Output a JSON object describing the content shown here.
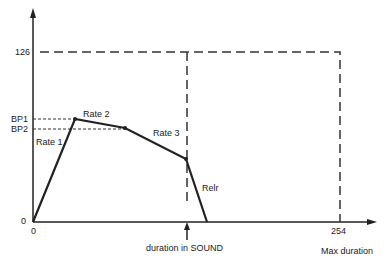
{
  "diagram": {
    "y_ticks": {
      "top": "126",
      "bp1": "BP1",
      "bp2": "BP2",
      "zero": "0"
    },
    "x_ticks": {
      "zero": "0",
      "max": "254"
    },
    "segments": {
      "rate1": "Rate 1",
      "rate2": "Rate 2",
      "rate3": "Rate 3",
      "release": "Relr"
    },
    "annotations": {
      "duration": "duration in SOUND",
      "max_duration": "Max duration"
    },
    "envelope_points": [
      [
        0,
        0
      ],
      [
        1,
        "BP1"
      ],
      [
        2,
        "BP2"
      ],
      [
        3,
        "sustain"
      ],
      [
        4,
        0
      ]
    ],
    "color": "#222222"
  }
}
